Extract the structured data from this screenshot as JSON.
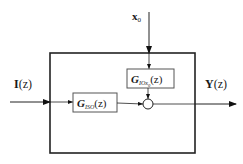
{
  "diagram": {
    "type": "block-diagram",
    "colors": {
      "line": "#222222",
      "box": "#555555",
      "background": "#ffffff"
    },
    "input": {
      "symbol": "I",
      "arg": "(z)"
    },
    "output": {
      "symbol": "Y",
      "arg": "(z)"
    },
    "initial_state": {
      "symbol": "x",
      "subscript": "0"
    },
    "blocks": [
      {
        "id": "g-iso",
        "symbol": "G",
        "subscript": "ISO",
        "arg": "(z)"
      },
      {
        "id": "g-iox0",
        "symbol": "G",
        "subscript": "IOx",
        "subsubscript": "0",
        "arg": "(z)"
      }
    ],
    "junction": {
      "type": "summing-point"
    }
  }
}
